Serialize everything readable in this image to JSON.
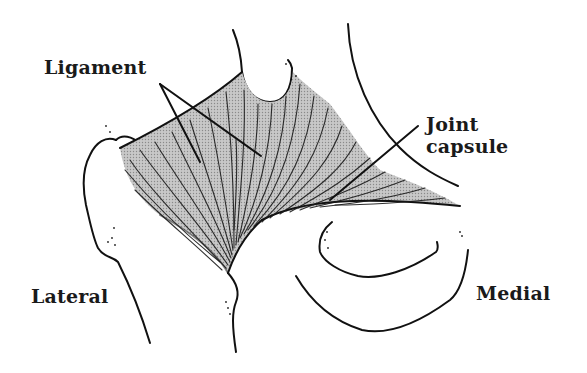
{
  "figure": {
    "type": "anatomical-line-drawing",
    "colors": {
      "background": "#ffffff",
      "ligament_fill": "#bdbdbd",
      "line": "#111111",
      "text": "#1a1a1a"
    }
  },
  "labels": {
    "ligament": "Ligament",
    "joint_capsule_line1": "Joint",
    "joint_capsule_line2": "capsule",
    "lateral": "Lateral",
    "medial": "Medial"
  }
}
